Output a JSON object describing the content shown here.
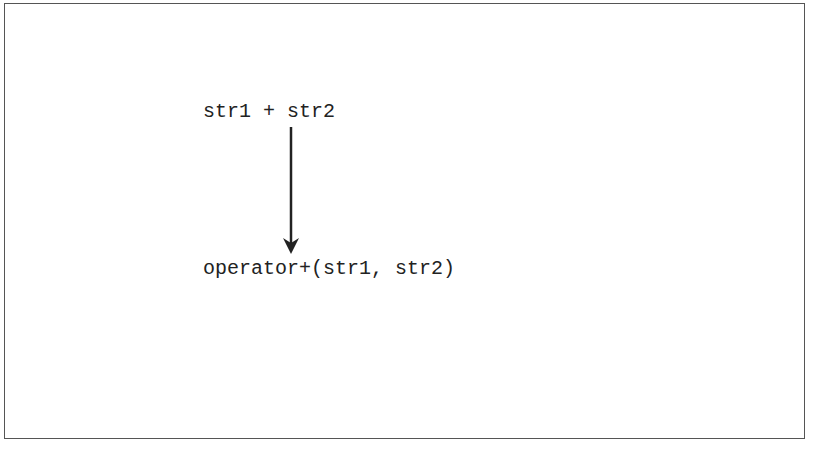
{
  "diagram": {
    "expression": "str1 + str2",
    "translation": "operator+(str1, str2)",
    "arrow": {
      "direction": "down",
      "color": "#222222"
    },
    "border_color": "#555555"
  }
}
